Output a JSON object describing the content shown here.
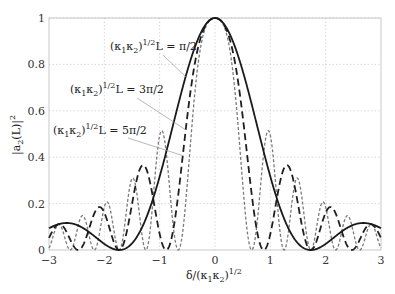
{
  "chart_data": {
    "type": "line",
    "title": "",
    "xlabel": "δ/(κ₁κ₂)^1/2",
    "ylabel": "|a₂(L)|²",
    "xlim": [
      -3,
      3
    ],
    "ylim": [
      0,
      1
    ],
    "grid": true,
    "x_ticks": [
      "−3",
      "−2",
      "−1",
      "0",
      "1",
      "2",
      "3"
    ],
    "x_tick_values": [
      -3,
      -2,
      -1,
      0,
      1,
      2,
      3
    ],
    "y_ticks": [
      "0",
      "0.2",
      "0.4",
      "0.6",
      "0.8",
      "1"
    ],
    "y_tick_values": [
      0,
      0.2,
      0.4,
      0.6,
      0.8,
      1
    ],
    "formula": "sin^2(theta*sqrt(1+x^2))/(1+x^2)",
    "series": [
      {
        "name": "(κ₁κ₂)^1/2 L = π/2",
        "theta_over_pi": 0.5,
        "style": "solid",
        "x": [
          -3,
          -2.5,
          -2,
          -1.732,
          -1.5,
          -1,
          -0.5,
          0,
          0.5,
          1,
          1.5,
          1.732,
          2,
          2.5,
          3
        ],
        "values": [
          0.1,
          0.11,
          0.07,
          0.0,
          0.02,
          0.4,
          0.82,
          1.0,
          0.82,
          0.4,
          0.02,
          0.0,
          0.07,
          0.11,
          0.1
        ]
      },
      {
        "name": "(κ₁κ₂)^1/2 L = 3π/2",
        "theta_over_pi": 1.5,
        "style": "dashed",
        "x": [
          -3,
          -2.5,
          -2,
          -1.3,
          -0.9,
          -0.5,
          0,
          0.5,
          0.9,
          1.3,
          2,
          2.5,
          3
        ],
        "values": [
          0.0,
          0.08,
          0.14,
          0.36,
          0.0,
          0.55,
          1.0,
          0.55,
          0.0,
          0.36,
          0.14,
          0.08,
          0.0
        ]
      },
      {
        "name": "(κ₁κ₂)^1/2 L = 5π/2",
        "theta_over_pi": 2.5,
        "style": "dotted",
        "x": [
          -3,
          -2.2,
          -1.9,
          -1.5,
          -1.2,
          -0.85,
          -0.5,
          0,
          0.5,
          0.85,
          1.2,
          1.5,
          1.9,
          2.2,
          3
        ],
        "values": [
          0.09,
          0.14,
          0.2,
          0.33,
          0.0,
          0.43,
          0.0,
          1.0,
          0.0,
          0.43,
          0.0,
          0.33,
          0.2,
          0.14,
          0.09
        ]
      }
    ],
    "annotations": [
      {
        "text": "(κ₁κ₂)^1/2 L = π/2",
        "series": 0
      },
      {
        "text": "(κ₁κ₂)^1/2 L = 3π/2",
        "series": 1
      },
      {
        "text": "(κ₁κ₂)^1/2 L = 5π/2",
        "series": 2
      }
    ]
  },
  "labels": {
    "ylabel_main": "|a",
    "ylabel_sub": "2",
    "ylabel_rest": "(L)|",
    "ylabel_sup": "2",
    "xlabel_main": "δ/(κ",
    "xlabel_sub1": "1",
    "xlabel_mid": "κ",
    "xlabel_sub2": "2",
    "xlabel_close": ")",
    "xlabel_sup": "1/2",
    "ann_prefix": "(κ",
    "ann_sub1": "1",
    "ann_mid": "κ",
    "ann_sub2": "2",
    "ann_close": ")",
    "ann_sup": "1/2",
    "ann_L": "L = ",
    "ann0_val": "π/2",
    "ann1_val": "3π/2",
    "ann2_val": "5π/2"
  },
  "colors": {
    "grid": "#c8c8c8",
    "axis": "#bbbbbb",
    "solid": "#1a1a1a",
    "dashed": "#1f1f1f",
    "dotted": "#7a7a7a",
    "leader": "#9a9a9a"
  }
}
